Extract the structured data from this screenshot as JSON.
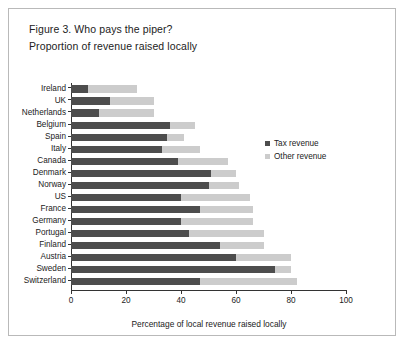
{
  "figure": {
    "title": "Figure 3. Who pays the piper?",
    "subtitle": "Proportion of revenue raised locally"
  },
  "legend": {
    "position": "right-inside",
    "items": [
      {
        "label": "Tax revenue",
        "color": "#4d4d4d"
      },
      {
        "label": "Other revenue",
        "color": "#cccccc"
      }
    ]
  },
  "chart_data": {
    "type": "bar",
    "orientation": "horizontal",
    "stacked": true,
    "title": "Figure 3. Who pays the piper?",
    "subtitle": "Proportion of revenue raised locally",
    "xlabel": "Percentage of local revenue raised locally",
    "ylabel": "",
    "xlim": [
      0,
      100
    ],
    "xticks": [
      0,
      20,
      40,
      60,
      80,
      100
    ],
    "xtick_labels": [
      "0",
      "20",
      "40",
      "60",
      "80",
      "100"
    ],
    "grid": false,
    "categories": [
      "Ireland",
      "UK",
      "Netherlands",
      "Belgium",
      "Spain",
      "Italy",
      "Canada",
      "Denmark",
      "Norway",
      "US",
      "France",
      "Germany",
      "Portugal",
      "Finland",
      "Austria",
      "Sweden",
      "Switzerland"
    ],
    "series": [
      {
        "name": "Tax revenue",
        "color": "#4d4d4d",
        "values": [
          6,
          14,
          10,
          36,
          35,
          33,
          39,
          51,
          50,
          40,
          47,
          40,
          43,
          54,
          60,
          74,
          47
        ]
      },
      {
        "name": "Other revenue",
        "color": "#cccccc",
        "values": [
          18,
          16,
          20,
          9,
          6,
          14,
          18,
          9,
          11,
          25,
          19,
          26,
          27,
          16,
          20,
          6,
          35
        ]
      }
    ],
    "totals": [
      24,
      30,
      30,
      45,
      41,
      47,
      57,
      60,
      61,
      65,
      66,
      66,
      70,
      70,
      80,
      80,
      82
    ]
  }
}
